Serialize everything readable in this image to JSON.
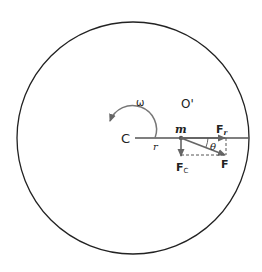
{
  "diagram": {
    "type": "rotating-frame-force-diagram",
    "labels": {
      "omega": "ω",
      "origin_prime": "O'",
      "center": "C",
      "radius": "r",
      "mass": "m",
      "radial_force": "F",
      "radial_force_sub": "r",
      "coriolis_force": "F",
      "coriolis_force_sub": "C",
      "resultant_force": "F",
      "angle": "θ"
    },
    "colors": {
      "outline": "#222222",
      "vector": "#666666",
      "dashed": "#555555"
    }
  }
}
